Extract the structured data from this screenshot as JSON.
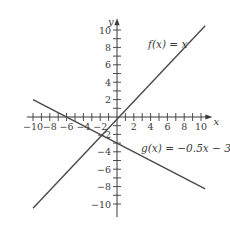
{
  "chart_data": {
    "type": "line",
    "title": "",
    "xlabel": "x",
    "ylabel": "y",
    "xlim": [
      -10.5,
      11
    ],
    "ylim": [
      -11.5,
      11
    ],
    "x_ticks": [
      -10,
      -8,
      -6,
      -4,
      -2,
      2,
      4,
      6,
      8,
      10
    ],
    "y_ticks": [
      -10,
      -8,
      -6,
      -4,
      -2,
      2,
      4,
      6,
      8,
      10
    ],
    "minor_tick_step": 1,
    "grid": false,
    "legend": null,
    "series": [
      {
        "name": "f(x) = x",
        "label": "f(x) = x",
        "x": [
          -10,
          10.5
        ],
        "y": [
          -10.5,
          10.5
        ],
        "equation": "f(x) = x"
      },
      {
        "name": "g(x) = −0.5x − 3",
        "label": "g(x) = −0.5x − 3",
        "x": [
          -10,
          10.5
        ],
        "y": [
          2,
          -8.25
        ],
        "equation": "g(x) = −0.5x − 3"
      }
    ],
    "annotations": [
      {
        "text": "f(x) = x",
        "near": [
          6,
          9
        ]
      },
      {
        "text": "g(x) = −0.5x − 3",
        "near": [
          6.5,
          -3.5
        ]
      }
    ],
    "intersection": [
      -2,
      -2
    ]
  },
  "labels": {
    "x_axis": "x",
    "y_axis": "y",
    "f_label": "f(x) = x",
    "g_label": "g(x) = −0.5x − 3"
  }
}
